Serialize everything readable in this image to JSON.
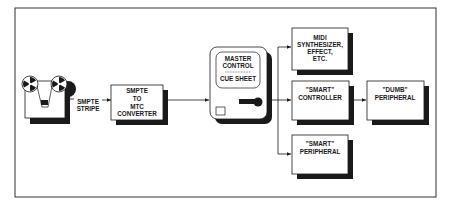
{
  "diagram": {
    "tape_deck": {
      "icon": "reel-to-reel-tape-icon"
    },
    "smpte_stripe": {
      "line1": "SMPTE",
      "line2": "STRIPE"
    },
    "converter": {
      "line1": "SMPTE",
      "line2": "TO",
      "line3": "MTC",
      "line4": "CONVERTER"
    },
    "master": {
      "line1": "MASTER",
      "line2": "CONTROL",
      "line3": "CUE SHEET"
    },
    "midi_synth": {
      "line1": "MIDI",
      "line2": "SYNTHESIZER,",
      "line3": "EFFECT,",
      "line4": "ETC."
    },
    "smart_controller": {
      "line1": "\"SMART\"",
      "line2": "CONTROLLER"
    },
    "dumb_peripheral": {
      "line1": "\"DUMB\"",
      "line2": "PERIPHERAL"
    },
    "smart_peripheral": {
      "line1": "\"SMART\"",
      "line2": "PERIPHERAL"
    }
  },
  "colors": {
    "ink": "#1a1a1a",
    "paper": "#ffffff"
  }
}
